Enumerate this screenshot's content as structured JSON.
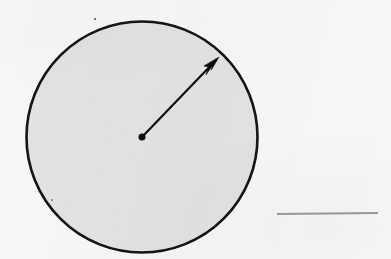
{
  "figure": {
    "domain_label": "geometry-diagram",
    "caption": "",
    "background_color": "#f7f7f7",
    "ink_color": "#111111",
    "circle": {
      "name": "shaded-circle",
      "center_x": 142,
      "center_y": 137,
      "radius": 116,
      "fill_color": "#e3e3e3",
      "stroke_color": "#121212",
      "stroke_width": 2.6,
      "label": ""
    },
    "center_point": {
      "name": "circle-center-dot",
      "x": 142,
      "y": 137,
      "diameter": 7,
      "color": "#111111",
      "label": ""
    },
    "radius_arrow": {
      "name": "radius-arrow",
      "from_x": 142,
      "from_y": 137,
      "to_x": 218,
      "to_y": 58,
      "stroke_color": "#111111",
      "stroke_width": 2.2,
      "arrowhead": "barbed-triangle",
      "label": ""
    },
    "rule_line": {
      "name": "horizontal-rule-line",
      "x1": 277,
      "y1": 214,
      "x2": 378,
      "y2": 213,
      "stroke_color": "#9a9a9a",
      "stroke_width": 2.0,
      "label": ""
    },
    "artifacts": [
      {
        "name": "scan-speck",
        "x": 95,
        "y": 19,
        "size": 2.4
      },
      {
        "name": "scan-speck",
        "x": 52,
        "y": 200,
        "size": 1.2
      }
    ]
  }
}
